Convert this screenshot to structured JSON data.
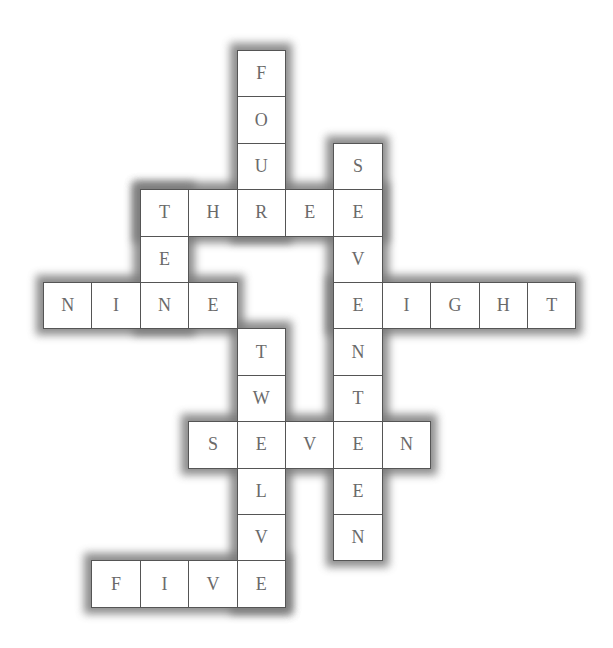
{
  "puzzle": {
    "type": "number-word crossword",
    "grid": {
      "origin_x": 43,
      "origin_y": 50,
      "cell_w": 48.4,
      "cell_h": 46.4,
      "cols": 11,
      "rows": 12
    },
    "colors": {
      "cell_bg": "#ffffff",
      "cell_border": "#555555",
      "letter": "#6a6a6a",
      "shadow": "#7a7a7a"
    },
    "words": [
      {
        "word": "FOUR",
        "dir": "down",
        "row": 0,
        "col": 4
      },
      {
        "word": "THREE",
        "dir": "across",
        "row": 3,
        "col": 2
      },
      {
        "word": "TEN",
        "dir": "down",
        "row": 3,
        "col": 2
      },
      {
        "word": "SEVENTEEN",
        "dir": "down",
        "row": 2,
        "col": 6
      },
      {
        "word": "NINE",
        "dir": "across",
        "row": 5,
        "col": 0
      },
      {
        "word": "EIGHT",
        "dir": "across",
        "row": 5,
        "col": 6
      },
      {
        "word": "TWELVE",
        "dir": "down",
        "row": 6,
        "col": 4
      },
      {
        "word": "SEVEN",
        "dir": "across",
        "row": 8,
        "col": 3
      },
      {
        "word": "FIVE",
        "dir": "across",
        "row": 11,
        "col": 1
      }
    ],
    "cells": [
      {
        "r": 0,
        "c": 4,
        "letter": "F"
      },
      {
        "r": 1,
        "c": 4,
        "letter": "O"
      },
      {
        "r": 2,
        "c": 4,
        "letter": "U"
      },
      {
        "r": 2,
        "c": 6,
        "letter": "S"
      },
      {
        "r": 3,
        "c": 2,
        "letter": "T"
      },
      {
        "r": 3,
        "c": 3,
        "letter": "H"
      },
      {
        "r": 3,
        "c": 4,
        "letter": "R"
      },
      {
        "r": 3,
        "c": 5,
        "letter": "E"
      },
      {
        "r": 3,
        "c": 6,
        "letter": "E"
      },
      {
        "r": 4,
        "c": 2,
        "letter": "E"
      },
      {
        "r": 4,
        "c": 6,
        "letter": "V"
      },
      {
        "r": 5,
        "c": 0,
        "letter": "N"
      },
      {
        "r": 5,
        "c": 1,
        "letter": "I"
      },
      {
        "r": 5,
        "c": 2,
        "letter": "N"
      },
      {
        "r": 5,
        "c": 3,
        "letter": "E"
      },
      {
        "r": 5,
        "c": 6,
        "letter": "E"
      },
      {
        "r": 5,
        "c": 7,
        "letter": "I"
      },
      {
        "r": 5,
        "c": 8,
        "letter": "G"
      },
      {
        "r": 5,
        "c": 9,
        "letter": "H"
      },
      {
        "r": 5,
        "c": 10,
        "letter": "T"
      },
      {
        "r": 6,
        "c": 4,
        "letter": "T"
      },
      {
        "r": 6,
        "c": 6,
        "letter": "N"
      },
      {
        "r": 7,
        "c": 4,
        "letter": "W"
      },
      {
        "r": 7,
        "c": 6,
        "letter": "T"
      },
      {
        "r": 8,
        "c": 3,
        "letter": "S"
      },
      {
        "r": 8,
        "c": 4,
        "letter": "E"
      },
      {
        "r": 8,
        "c": 5,
        "letter": "V"
      },
      {
        "r": 8,
        "c": 6,
        "letter": "E"
      },
      {
        "r": 8,
        "c": 7,
        "letter": "N"
      },
      {
        "r": 9,
        "c": 4,
        "letter": "L"
      },
      {
        "r": 9,
        "c": 6,
        "letter": "E"
      },
      {
        "r": 10,
        "c": 4,
        "letter": "V"
      },
      {
        "r": 10,
        "c": 6,
        "letter": "N"
      },
      {
        "r": 11,
        "c": 1,
        "letter": "F"
      },
      {
        "r": 11,
        "c": 2,
        "letter": "I"
      },
      {
        "r": 11,
        "c": 3,
        "letter": "V"
      },
      {
        "r": 11,
        "c": 4,
        "letter": "E"
      }
    ]
  }
}
